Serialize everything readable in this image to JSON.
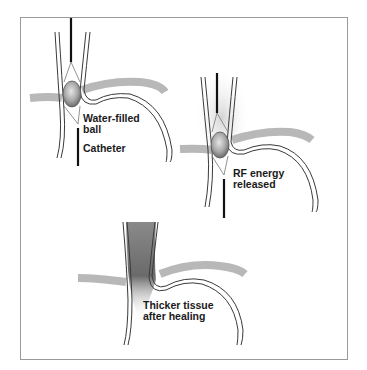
{
  "figure": {
    "panels": [
      {
        "id": "step-1",
        "labels": [
          {
            "text": "Water-filled\nball",
            "x": 83,
            "y": 113
          },
          {
            "text": "Catheter",
            "x": 83,
            "y": 143
          }
        ]
      },
      {
        "id": "step-2",
        "labels": [
          {
            "text": "RF energy\nreleased",
            "x": 233,
            "y": 168
          }
        ]
      },
      {
        "id": "step-3",
        "labels": [
          {
            "text": "Thicker tissue\nafter healing",
            "x": 143,
            "y": 300
          }
        ]
      }
    ],
    "colors": {
      "tissue_band": "#b8b8b8",
      "wall_line": "#3a3a3a",
      "catheter": "#111111",
      "balloon": "#a9a9a9",
      "frame": "#9a9a9a"
    }
  }
}
